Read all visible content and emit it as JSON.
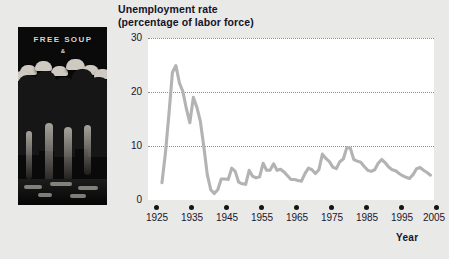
{
  "figure": {
    "title_line1": "Unemployment rate",
    "title_line2": "(percentage of labor force)",
    "x_axis_title": "Year",
    "line_color": "#b3b3b3",
    "plot_background": "#ffffff",
    "page_background": "#e9e9e7",
    "text_color": "#14132b"
  },
  "photo": {
    "caption_sign": "FREE SOUP",
    "caption_sign_sub": "&",
    "description": "black-and-white photograph of men in hats and overcoats standing in a Depression-era breadline beneath a FREE SOUP sign"
  },
  "chart_data": {
    "type": "line",
    "title": "Unemployment rate (percentage of labor force)",
    "xlabel": "Year",
    "ylabel": "",
    "xlim": [
      1925,
      2007
    ],
    "ylim": [
      0,
      30
    ],
    "yticks": [
      0,
      10,
      20,
      30
    ],
    "xticks": [
      1925,
      1935,
      1945,
      1955,
      1965,
      1975,
      1985,
      1995,
      2005
    ],
    "grid": "horizontal-dotted",
    "legend": "none",
    "series": [
      {
        "name": "Unemployment rate",
        "x": [
          1929,
          1930,
          1931,
          1932,
          1933,
          1934,
          1935,
          1936,
          1937,
          1938,
          1939,
          1940,
          1941,
          1942,
          1943,
          1944,
          1945,
          1946,
          1947,
          1948,
          1949,
          1950,
          1951,
          1952,
          1953,
          1954,
          1955,
          1956,
          1957,
          1958,
          1959,
          1960,
          1961,
          1962,
          1963,
          1964,
          1965,
          1966,
          1967,
          1968,
          1969,
          1970,
          1971,
          1972,
          1973,
          1974,
          1975,
          1976,
          1977,
          1978,
          1979,
          1980,
          1981,
          1982,
          1983,
          1984,
          1985,
          1986,
          1987,
          1988,
          1989,
          1990,
          1991,
          1992,
          1993,
          1994,
          1995,
          1996,
          1997,
          1998,
          1999,
          2000,
          2001,
          2002,
          2003,
          2004,
          2005,
          2006
        ],
        "values": [
          3.2,
          8.7,
          15.9,
          23.6,
          24.9,
          21.7,
          20.1,
          16.9,
          14.3,
          19.0,
          17.2,
          14.6,
          9.9,
          4.7,
          1.9,
          1.2,
          1.9,
          3.9,
          3.9,
          3.8,
          5.9,
          5.3,
          3.3,
          3.0,
          2.9,
          5.5,
          4.4,
          4.1,
          4.3,
          6.8,
          5.5,
          5.5,
          6.7,
          5.5,
          5.7,
          5.2,
          4.5,
          3.8,
          3.8,
          3.6,
          3.5,
          4.9,
          5.9,
          5.6,
          4.9,
          5.6,
          8.5,
          7.7,
          7.1,
          6.1,
          5.8,
          7.1,
          7.6,
          9.7,
          9.6,
          7.5,
          7.2,
          7.0,
          6.2,
          5.5,
          5.3,
          5.6,
          6.8,
          7.5,
          6.9,
          6.1,
          5.6,
          5.4,
          4.9,
          4.5,
          4.2,
          4.0,
          4.7,
          5.8,
          6.0,
          5.5,
          5.1,
          4.6
        ]
      }
    ],
    "annotations": [
      {
        "text": "Great Depression peak",
        "x": 1933,
        "y": 24.9
      },
      {
        "text": "World War II trough",
        "x": 1944,
        "y": 1.2
      },
      {
        "text": "1982 recession peak",
        "x": 1982,
        "y": 9.7
      }
    ]
  }
}
